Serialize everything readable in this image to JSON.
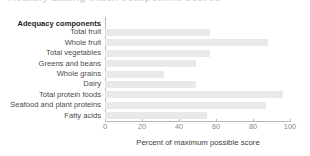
{
  "chart_data": {
    "type": "bar",
    "orientation": "horizontal",
    "title": "Healthy Eating Index component scores",
    "group_header": "Adequacy components",
    "categories": [
      "Total fruit",
      "Whole fruit",
      "Total vegetables",
      "Greens and beans",
      "Whole grains",
      "Dairy",
      "Total protein foods",
      "Seafood and plant proteins",
      "Fatty acids"
    ],
    "values": [
      57,
      88,
      57,
      49,
      32,
      49,
      96,
      87,
      55
    ],
    "xlabel": "Percent of maximum possible score",
    "ylabel": "",
    "xlim": [
      0,
      100
    ],
    "xticks": [
      0,
      20,
      40,
      60,
      80,
      100
    ],
    "xtick_labels": [
      "0",
      "20",
      "40",
      "60",
      "80",
      "100"
    ],
    "grid": false,
    "legend": false,
    "bar_color": "#e9e9e9",
    "axis_color": "#b9b9b9",
    "label_color": "#4a4a4a"
  }
}
